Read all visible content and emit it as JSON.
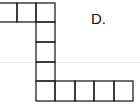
{
  "option": {
    "label": "D."
  },
  "figure": {
    "stroke_color": "#222222",
    "top_row_squares": 3,
    "column_squares": 3,
    "bottom_row_squares": 5
  }
}
